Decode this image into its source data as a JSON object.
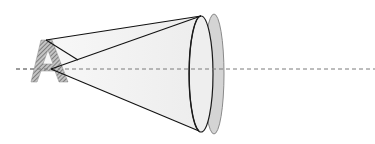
{
  "diagram": {
    "type": "optics-ray-diagram",
    "object_label": "A",
    "optical_axis": {
      "y": 69,
      "x_start": 16,
      "x_end": 375,
      "style": "dashed",
      "color": "#7a7a7a"
    },
    "object": {
      "glyph": "A",
      "fill_pattern": "diagonal-hatch",
      "hatch_color": "#6b6b6b",
      "base_color": "#bdbdbd"
    },
    "lens_front": {
      "cx": 201,
      "cy": 74,
      "rx": 12,
      "ry": 58,
      "fill": "#eeeeee",
      "stroke": "#1a1a1a"
    },
    "lens_back": {
      "cx": 214,
      "cy": 74,
      "rx": 10,
      "ry": 60,
      "fill": "#d4d4d4",
      "stroke": "#8a8a8a"
    },
    "cone_fill": "#f1f1f1",
    "ray_color": "#111111"
  }
}
